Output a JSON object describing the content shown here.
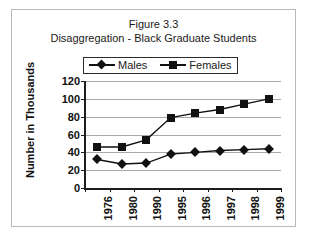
{
  "figure": {
    "title_line1": "Figure 3.3",
    "title_line2": "Disaggregation - Black Graduate Students"
  },
  "chart_data": {
    "type": "line",
    "title": "Figure 3.3 Disaggregation - Black Graduate Students",
    "subtitle": "Disaggregation - Black Graduate Students",
    "xlabel": "",
    "ylabel": "Number in Thousands",
    "categories": [
      "1976",
      "1980",
      "1990",
      "1995",
      "1996",
      "1997",
      "1998",
      "1999"
    ],
    "series": [
      {
        "name": "Males",
        "marker": "diamond",
        "color": "#111111",
        "values": [
          32,
          27,
          28,
          38,
          40,
          42,
          43,
          44
        ]
      },
      {
        "name": "Females",
        "marker": "square",
        "color": "#111111",
        "values": [
          46,
          46,
          54,
          79,
          84,
          88,
          94,
          100
        ]
      }
    ],
    "ylim": [
      0,
      120
    ],
    "yticks": [
      0,
      20,
      40,
      60,
      80,
      100,
      120
    ],
    "ytick_labels": [
      "0",
      "20",
      "40",
      "60",
      "80",
      "100",
      "120"
    ],
    "grid": "horizontal",
    "legend_position": "top-center"
  },
  "legend": {
    "entries": [
      {
        "label": "Males",
        "marker": "diamond-marker"
      },
      {
        "label": "Females",
        "marker": "square-marker"
      }
    ]
  }
}
